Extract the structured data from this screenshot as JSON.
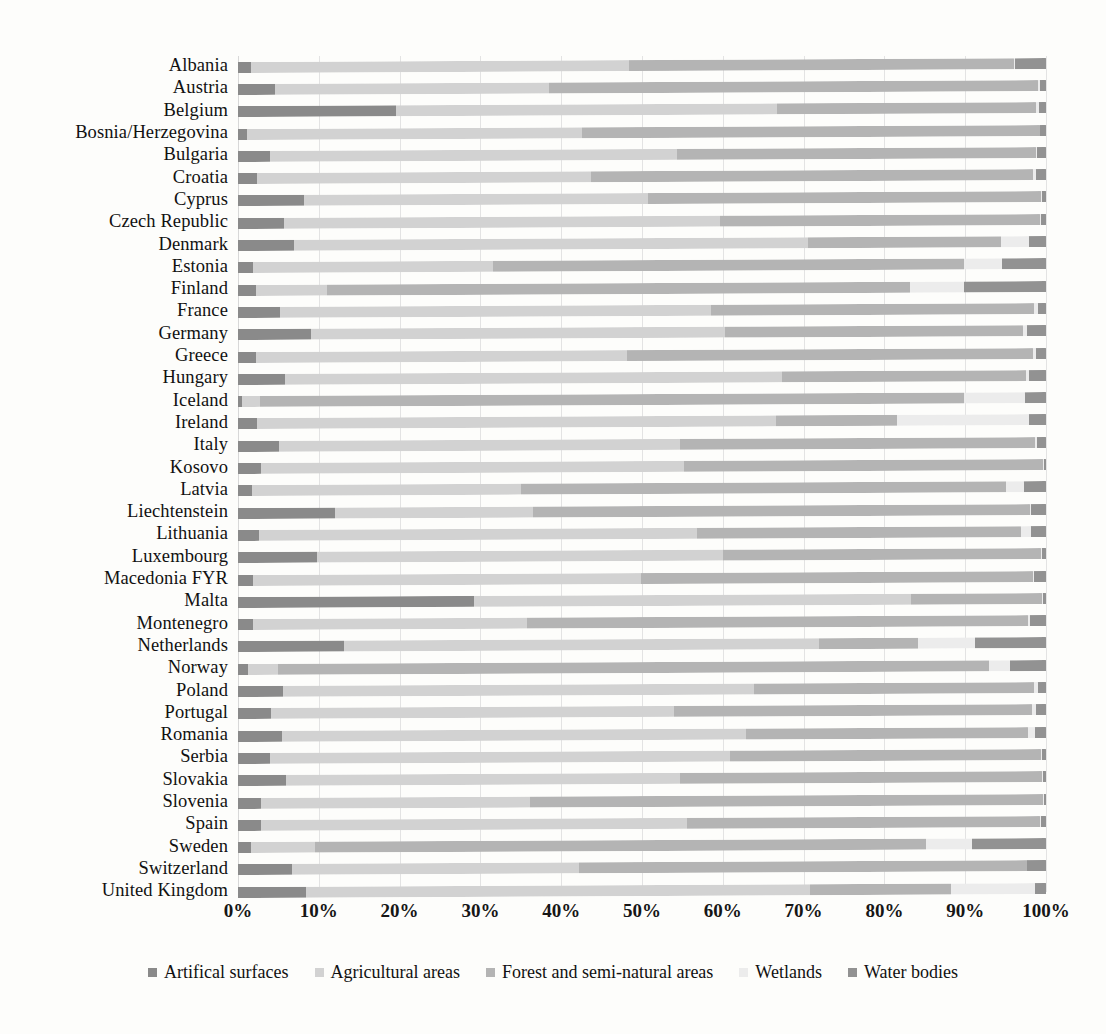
{
  "chart_data": {
    "type": "bar",
    "orientation": "horizontal",
    "stacked": true,
    "normalized": true,
    "title": "",
    "xlabel": "",
    "ylabel": "",
    "xlim": [
      0,
      100
    ],
    "xticks": [
      "0%",
      "10%",
      "20%",
      "30%",
      "40%",
      "50%",
      "60%",
      "70%",
      "80%",
      "90%",
      "100%"
    ],
    "grid": true,
    "legend_position": "bottom",
    "series": [
      {
        "name": "Artifical surfaces",
        "color": "#8a8a8a"
      },
      {
        "name": "Agricultural areas",
        "color": "#d2d2d2"
      },
      {
        "name": "Forest and semi-natural areas",
        "color": "#b4b4b4"
      },
      {
        "name": "Wetlands",
        "color": "#ececec"
      },
      {
        "name": "Water bodies",
        "color": "#929292"
      }
    ],
    "categories": [
      "Albania",
      "Austria",
      "Belgium",
      "Bosnia/Herzegovina",
      "Bulgaria",
      "Croatia",
      "Cyprus",
      "Czech Republic",
      "Denmark",
      "Estonia",
      "Finland",
      "France",
      "Germany",
      "Greece",
      "Hungary",
      "Iceland",
      "Ireland",
      "Italy",
      "Kosovo",
      "Latvia",
      "Liechtenstein",
      "Lithuania",
      "Luxembourg",
      "Macedonia FYR",
      "Malta",
      "Montenegro",
      "Netherlands",
      "Norway",
      "Poland",
      "Portugal",
      "Romania",
      "Serbia",
      "Slovakia",
      "Slovenia",
      "Spain",
      "Sweden",
      "Switzerland",
      "United Kingdom"
    ],
    "rows": [
      {
        "country": "Albania",
        "values": [
          1.6,
          46.8,
          47.6,
          0.2,
          3.8
        ]
      },
      {
        "country": "Austria",
        "values": [
          4.6,
          33.9,
          60.5,
          0.2,
          0.8
        ]
      },
      {
        "country": "Belgium",
        "values": [
          19.6,
          47.1,
          32.1,
          0.3,
          0.9
        ]
      },
      {
        "country": "Bosnia/Herzegovina",
        "values": [
          1.1,
          41.5,
          56.6,
          0.1,
          0.7
        ]
      },
      {
        "country": "Bulgaria",
        "values": [
          3.9,
          50.4,
          44.5,
          0.1,
          1.1
        ]
      },
      {
        "country": "Croatia",
        "values": [
          2.4,
          41.3,
          54.7,
          0.4,
          1.2
        ]
      },
      {
        "country": "Cyprus",
        "values": [
          8.2,
          42.6,
          48.6,
          0.1,
          0.5
        ]
      },
      {
        "country": "Czech Republic",
        "values": [
          5.7,
          53.9,
          39.7,
          0.1,
          0.6
        ]
      },
      {
        "country": "Denmark",
        "values": [
          6.9,
          63.7,
          23.8,
          3.5,
          2.1
        ]
      },
      {
        "country": "Estonia",
        "values": [
          1.9,
          29.6,
          58.3,
          4.8,
          5.4
        ]
      },
      {
        "country": "Finland",
        "values": [
          2.2,
          8.8,
          72.2,
          6.6,
          10.2
        ]
      },
      {
        "country": "France",
        "values": [
          5.2,
          53.3,
          40.0,
          0.5,
          1.0
        ]
      },
      {
        "country": "Germany",
        "values": [
          9.0,
          51.3,
          36.8,
          0.5,
          2.4
        ]
      },
      {
        "country": "Greece",
        "values": [
          2.2,
          46.0,
          50.2,
          0.4,
          1.2
        ]
      },
      {
        "country": "Hungary",
        "values": [
          5.8,
          61.5,
          30.2,
          0.4,
          2.1
        ]
      },
      {
        "country": "Iceland",
        "values": [
          0.5,
          2.2,
          87.1,
          7.6,
          2.6
        ]
      },
      {
        "country": "Ireland",
        "values": [
          2.3,
          64.3,
          14.9,
          16.4,
          2.1
        ]
      },
      {
        "country": "Italy",
        "values": [
          5.1,
          49.6,
          44.0,
          0.2,
          1.1
        ]
      },
      {
        "country": "Kosovo",
        "values": [
          2.8,
          52.4,
          44.4,
          0.1,
          0.3
        ]
      },
      {
        "country": "Latvia",
        "values": [
          1.7,
          33.3,
          60.0,
          2.3,
          2.7
        ]
      },
      {
        "country": "Liechtenstein",
        "values": [
          12.0,
          24.5,
          61.5,
          0.2,
          1.8
        ]
      },
      {
        "country": "Lithuania",
        "values": [
          2.6,
          54.2,
          40.1,
          1.2,
          1.9
        ]
      },
      {
        "country": "Luxembourg",
        "values": [
          9.8,
          50.2,
          39.4,
          0.1,
          0.5
        ]
      },
      {
        "country": "Macedonia FYR",
        "values": [
          1.9,
          48.0,
          48.5,
          0.1,
          1.5
        ]
      },
      {
        "country": "Malta",
        "values": [
          29.2,
          54.1,
          16.2,
          0.1,
          0.4
        ]
      },
      {
        "country": "Montenegro",
        "values": [
          1.8,
          34.0,
          62.0,
          0.2,
          2.0
        ]
      },
      {
        "country": "Netherlands",
        "values": [
          13.1,
          58.8,
          12.3,
          7.0,
          8.8
        ]
      },
      {
        "country": "Norway",
        "values": [
          1.2,
          3.7,
          88.0,
          2.6,
          4.5
        ]
      },
      {
        "country": "Poland",
        "values": [
          5.6,
          58.3,
          34.6,
          0.5,
          1.0
        ]
      },
      {
        "country": "Portugal",
        "values": [
          4.1,
          49.9,
          44.3,
          0.5,
          1.2
        ]
      },
      {
        "country": "Romania",
        "values": [
          5.4,
          57.5,
          34.9,
          0.9,
          1.3
        ]
      },
      {
        "country": "Serbia",
        "values": [
          3.9,
          57.0,
          38.5,
          0.1,
          0.5
        ]
      },
      {
        "country": "Slovakia",
        "values": [
          6.0,
          48.7,
          44.8,
          0.1,
          0.4
        ]
      },
      {
        "country": "Slovenia",
        "values": [
          2.9,
          33.3,
          63.4,
          0.1,
          0.3
        ]
      },
      {
        "country": "Spain",
        "values": [
          2.9,
          52.7,
          43.6,
          0.2,
          0.6
        ]
      },
      {
        "country": "Sweden",
        "values": [
          1.6,
          7.9,
          75.6,
          5.7,
          9.2
        ]
      },
      {
        "country": "Switzerland",
        "values": [
          6.7,
          35.5,
          55.4,
          0.1,
          2.3
        ]
      },
      {
        "country": "United Kingdom",
        "values": [
          8.4,
          62.4,
          17.4,
          10.5,
          1.3
        ]
      }
    ]
  },
  "legend": {
    "items": [
      {
        "label": "Artifical surfaces",
        "color": "#8a8a8a"
      },
      {
        "label": "Agricultural areas",
        "color": "#d2d2d2"
      },
      {
        "label": "Forest and semi-natural areas",
        "color": "#b4b4b4"
      },
      {
        "label": "Wetlands",
        "color": "#ececec"
      },
      {
        "label": "Water bodies",
        "color": "#929292"
      }
    ]
  }
}
